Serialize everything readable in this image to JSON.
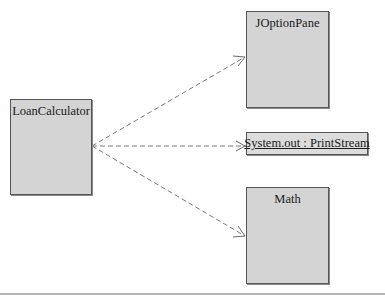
{
  "diagram": {
    "type": "uml-class-dependency",
    "nodes": [
      {
        "id": "loan-calculator",
        "label": "LoanCalculator",
        "kind": "class"
      },
      {
        "id": "joptionpane",
        "label": "JOptionPane",
        "kind": "class"
      },
      {
        "id": "system-out",
        "label": "System.out : PrintStream",
        "kind": "object"
      },
      {
        "id": "math",
        "label": "Math",
        "kind": "class"
      }
    ],
    "edges": [
      {
        "from": "loan-calculator",
        "to": "joptionpane",
        "style": "dashed",
        "arrow": "open"
      },
      {
        "from": "loan-calculator",
        "to": "system-out",
        "style": "dashed",
        "arrow": "open"
      },
      {
        "from": "loan-calculator",
        "to": "math",
        "style": "dashed",
        "arrow": "open"
      }
    ],
    "colors": {
      "box_fill": "#d4d4d4",
      "box_border": "#555555",
      "edge": "#7a7a7a"
    }
  }
}
